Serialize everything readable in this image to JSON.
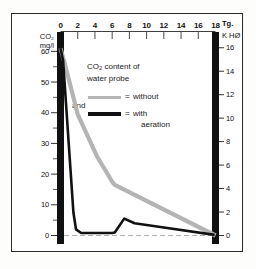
{
  "chart_data": {
    "type": "line",
    "title": "CO2 content of water probe",
    "xlabel": "Tg.",
    "ylabel": "CO2 mg/l",
    "y2label": "K HØ",
    "xlim": [
      0,
      18
    ],
    "ylim": [
      0,
      65
    ],
    "y2lim": [
      0,
      17
    ],
    "x_ticks": [
      0,
      2,
      4,
      6,
      8,
      10,
      12,
      14,
      16,
      18
    ],
    "x_tick_labels": [
      "0",
      "2",
      "4",
      "6",
      "8",
      "10",
      "12",
      "14",
      "16",
      "18"
    ],
    "y_ticks": [
      0,
      10,
      20,
      30,
      40,
      50,
      60
    ],
    "y_tick_labels": [
      "0",
      "10",
      "20",
      "30",
      "40",
      "50",
      "60"
    ],
    "y_minor_ticks": [
      5,
      15,
      25,
      35,
      45,
      55
    ],
    "y2_ticks": [
      0,
      2,
      4,
      6,
      8,
      10,
      12,
      14,
      16
    ],
    "y2_tick_labels": [
      "0",
      "2",
      "4",
      "6",
      "8",
      "10",
      "12",
      "14",
      "16"
    ],
    "grid": false,
    "zero_line": true,
    "legend_position": "upper-center",
    "series": [
      {
        "name": "without aeration",
        "color": "#b4b4b4",
        "x": [
          0,
          0.4,
          2.0,
          4.2,
          6.0,
          6.3,
          18.0
        ],
        "values": [
          61,
          57,
          39.5,
          26,
          17.5,
          16.5,
          0
        ]
      },
      {
        "name": "with aeration",
        "color": "#111111",
        "x": [
          0,
          0.3,
          1.5,
          1.8,
          2.4,
          6.0,
          6.3,
          7.4,
          8.6,
          12.0,
          17.9
        ],
        "values": [
          61,
          57,
          7.5,
          2.0,
          0.8,
          0.8,
          1.0,
          5.5,
          4.0,
          2.6,
          0.2
        ]
      }
    ]
  },
  "legend": {
    "line1": "CO₂ content of",
    "line2": "water probe",
    "equals1": "=",
    "without": "without",
    "and": "and",
    "equals2": "=",
    "with": "with",
    "aeration": "aeration"
  },
  "axes": {
    "left_title_line1": "CO₂",
    "left_title_line2": "mg/l",
    "top_title": "Tg.",
    "right_title": "K HØ"
  },
  "colors": {
    "without_aeration": "#b4b4b4",
    "with_aeration": "#111111",
    "axis_bar": "#111111",
    "frame": "#2a2a2a",
    "background": "#ffffff"
  }
}
